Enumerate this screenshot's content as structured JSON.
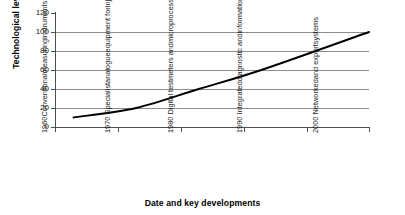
{
  "chart_data": {
    "type": "line",
    "title": "",
    "xlabel": "Date and key developments",
    "ylabel": "Technological level",
    "ylim": [
      0,
      120
    ],
    "yticks": [
      0,
      20,
      40,
      60,
      80,
      100,
      120
    ],
    "grid": true,
    "legend": false,
    "legend_position": "none",
    "line_color": "#000000",
    "grid_color": "#8d8d8d",
    "background_color": "#ffffff",
    "categories": [
      "1960 Conventional measuring instruments",
      "1970 Specialist analogue equipment for injection and ABS",
      "1980 Digital test meters and microprocessor controlled systems",
      "1990 Integrated diagnostic and information systems",
      "2000 Networked and expert systems"
    ],
    "category_lines": [
      [
        "1960",
        "Conventional",
        "measuring",
        "instruments"
      ],
      [
        "1970 Specialist",
        "analogue",
        "equipment for",
        "injection and",
        "ABS"
      ],
      [
        "1980 Digital test",
        "meters and",
        "microprocessor",
        "controlled",
        "systems"
      ],
      [
        "1990 Integrated",
        "diagnostic and",
        "information",
        "systems"
      ],
      [
        "2000 Networked",
        "and expert",
        "systems"
      ]
    ],
    "x": [
      1960,
      1970,
      1980,
      1990,
      2000
    ],
    "values": [
      10,
      20,
      40,
      60,
      100
    ],
    "series": [
      {
        "name": "Technological level",
        "values": [
          10,
          20,
          40,
          60,
          100
        ]
      }
    ]
  },
  "axes": {
    "y_tick_labels": [
      "120",
      "100",
      "80",
      "60",
      "40",
      "20",
      "0"
    ],
    "y_title": "Technological level",
    "x_title": "Date and key developments"
  }
}
